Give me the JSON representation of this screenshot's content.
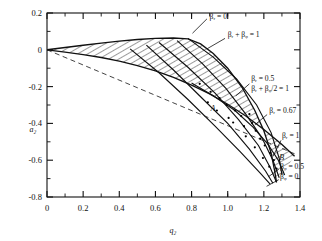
{
  "chart_data": {
    "type": "line",
    "title": "",
    "xlabel": "q_z",
    "ylabel": "a_z",
    "xlim": [
      0,
      1.4
    ],
    "ylim": [
      -0.8,
      0.2
    ],
    "grid": false,
    "legend": "none",
    "x_ticks_major": [
      "0",
      "0.2",
      "0.4",
      "0.6",
      "0.8",
      "1.0",
      "1.2",
      "1.4"
    ],
    "x_ticks_major_values": [
      0,
      0.2,
      0.4,
      0.6,
      0.8,
      1.0,
      1.2,
      1.4
    ],
    "x_minor_step": 0.1,
    "y_ticks_major": [
      "0.2",
      "0",
      "-0.2",
      "-0.4",
      "-0.6",
      "-0.8"
    ],
    "y_ticks_major_values": [
      0.2,
      0,
      -0.2,
      -0.4,
      -0.6,
      -0.8
    ],
    "y_minor_step": 0.1,
    "series": [
      {
        "name": "beta_r = 0 (upper stability boundary)",
        "values": [
          [
            0,
            0
          ],
          [
            0.1,
            0.0125
          ],
          [
            0.2,
            0.0248
          ],
          [
            0.3,
            0.0365
          ],
          [
            0.4,
            0.047
          ],
          [
            0.5,
            0.056
          ],
          [
            0.6,
            0.0625
          ],
          [
            0.7,
            0.064
          ],
          [
            0.78,
            0.059
          ],
          [
            0.85,
            0.032
          ],
          [
            0.92,
            -0.02
          ],
          [
            1.0,
            -0.1
          ],
          [
            1.08,
            -0.205
          ],
          [
            1.15,
            -0.33
          ],
          [
            1.2,
            -0.44
          ],
          [
            1.24,
            -0.56
          ],
          [
            1.26,
            -0.66
          ],
          [
            1.27,
            -0.72
          ]
        ]
      },
      {
        "name": "beta_z = 0 (lower stability boundary)",
        "values": [
          [
            0,
            0
          ],
          [
            0.1,
            -0.0125
          ],
          [
            0.2,
            -0.026
          ],
          [
            0.3,
            -0.042
          ],
          [
            0.4,
            -0.0615
          ],
          [
            0.5,
            -0.086
          ],
          [
            0.6,
            -0.115
          ],
          [
            0.7,
            -0.15
          ],
          [
            0.8,
            -0.192
          ],
          [
            0.9,
            -0.24
          ],
          [
            1.0,
            -0.296
          ],
          [
            1.1,
            -0.36
          ],
          [
            1.2,
            -0.433
          ],
          [
            1.3,
            -0.515
          ],
          [
            1.37,
            -0.578
          ]
        ]
      },
      {
        "name": "asymptote (dashed)",
        "values": [
          [
            0,
            0
          ],
          [
            1.37,
            -0.565
          ]
        ]
      },
      {
        "name": "beta_r + beta_z = 1",
        "values": [
          [
            0.78,
            0.062
          ],
          [
            0.92,
            -0.04
          ],
          [
            1.05,
            -0.16
          ],
          [
            1.16,
            -0.3
          ],
          [
            1.24,
            -0.45
          ],
          [
            1.285,
            -0.59
          ],
          [
            1.3,
            -0.68
          ]
        ]
      },
      {
        "name": "beta_r + beta_z/2 = 1",
        "values": [
          [
            0.72,
            0.05
          ],
          [
            0.86,
            -0.075
          ],
          [
            0.99,
            -0.21
          ],
          [
            1.1,
            -0.35
          ],
          [
            1.19,
            -0.48
          ],
          [
            1.25,
            -0.6
          ],
          [
            1.285,
            -0.695
          ]
        ]
      },
      {
        "name": "beta_r = 0.5",
        "values": [
          [
            0.62,
            0.04
          ],
          [
            0.78,
            -0.095
          ],
          [
            0.93,
            -0.235
          ],
          [
            1.06,
            -0.38
          ],
          [
            1.17,
            -0.52
          ],
          [
            1.235,
            -0.64
          ],
          [
            1.27,
            -0.72
          ]
        ]
      },
      {
        "name": "beta_r = 0.67",
        "values": [
          [
            0.55,
            0.025
          ],
          [
            0.7,
            -0.11
          ],
          [
            0.85,
            -0.255
          ],
          [
            1.0,
            -0.4
          ],
          [
            1.12,
            -0.54
          ],
          [
            1.21,
            -0.66
          ],
          [
            1.25,
            -0.725
          ]
        ]
      },
      {
        "name": "beta_r = 1",
        "values": [
          [
            0.46,
            0.005
          ],
          [
            0.62,
            -0.125
          ],
          [
            0.78,
            -0.27
          ],
          [
            0.93,
            -0.415
          ],
          [
            1.07,
            -0.555
          ],
          [
            1.18,
            -0.67
          ],
          [
            1.235,
            -0.73
          ]
        ]
      },
      {
        "name": "beta_z = 0.5",
        "values": [
          [
            0.8,
            -0.18
          ],
          [
            0.92,
            -0.25
          ],
          [
            1.04,
            -0.33
          ],
          [
            1.14,
            -0.42
          ],
          [
            1.22,
            -0.51
          ],
          [
            1.28,
            -0.6
          ],
          [
            1.315,
            -0.68
          ]
        ]
      }
    ],
    "annotations": [
      {
        "text": "βᵣ = 0",
        "x": 0.9,
        "y": 0.17
      },
      {
        "text": "βᵣ + βᵩ = 1",
        "x": 1.0,
        "y": 0.07
      },
      {
        "text": "βᵣ = 0.5",
        "x": 1.13,
        "y": -0.17
      },
      {
        "text": "βᵣ + βᵩ/2 = 1",
        "x": 1.13,
        "y": -0.225
      },
      {
        "text": "βᵣ = 0.67",
        "x": 1.23,
        "y": -0.345
      },
      {
        "text": "βᵣ = 1",
        "x": 1.3,
        "y": -0.48
      },
      {
        "text": "βᵩ = 0.5",
        "x": 1.29,
        "y": -0.645
      },
      {
        "text": "βᵩ = 0",
        "x": 1.29,
        "y": -0.7
      },
      {
        "text": "A",
        "x": 0.905,
        "y": -0.335
      },
      {
        "text": "B",
        "x": 1.285,
        "y": -0.6
      }
    ],
    "point_markers_label": "data points inside hatched band",
    "point_markers": [
      [
        0.845,
        -0.185
      ],
      [
        0.905,
        -0.228
      ],
      [
        0.955,
        -0.262
      ],
      [
        0.995,
        -0.3
      ],
      [
        1.04,
        -0.33
      ],
      [
        1.075,
        -0.36
      ],
      [
        1.03,
        -0.395
      ],
      [
        1.09,
        -0.415
      ],
      [
        1.135,
        -0.398
      ],
      [
        1.155,
        -0.44
      ],
      [
        1.1,
        -0.47
      ],
      [
        1.18,
        -0.482
      ],
      [
        1.205,
        -0.52
      ],
      [
        1.15,
        -0.53
      ],
      [
        1.235,
        -0.56
      ],
      [
        1.195,
        -0.588
      ],
      [
        1.255,
        -0.6
      ],
      [
        1.23,
        -0.635
      ],
      [
        1.27,
        -0.645
      ],
      [
        0.89,
        -0.285
      ],
      [
        0.94,
        -0.33
      ],
      [
        1.005,
        -0.37
      ],
      [
        1.12,
        -0.35
      ]
    ]
  },
  "axes": {
    "x_label": "q₂",
    "y_label": "a₂"
  }
}
